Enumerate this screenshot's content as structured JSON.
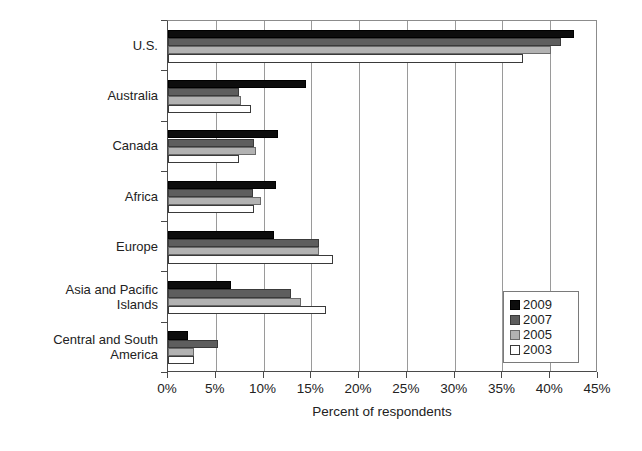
{
  "chart_data": {
    "type": "bar",
    "orientation": "horizontal",
    "title": "",
    "xlabel": "Percent of respondents",
    "ylabel": "",
    "xlim": [
      0,
      45
    ],
    "xticks": [
      "0%",
      "5%",
      "10%",
      "15%",
      "20%",
      "25%",
      "30%",
      "35%",
      "40%",
      "45%"
    ],
    "xtick_values": [
      0,
      5,
      10,
      15,
      20,
      25,
      30,
      35,
      40,
      45
    ],
    "grid": "vertical",
    "legend_position": "lower-right",
    "categories": [
      "U.S.",
      "Australia",
      "Canada",
      "Africa",
      "Europe",
      "Asia and Pacific\nIslands",
      "Central and South\nAmerica"
    ],
    "series": [
      {
        "name": "2009",
        "color": "#0d0d0d",
        "values": [
          42.5,
          14.4,
          11.5,
          11.3,
          11.1,
          6.6,
          2.1
        ]
      },
      {
        "name": "2007",
        "color": "#5e5e5e",
        "values": [
          41.1,
          7.4,
          9.0,
          8.9,
          15.8,
          12.9,
          5.2
        ]
      },
      {
        "name": "2005",
        "color": "#b2b2b2",
        "values": [
          40.1,
          7.6,
          9.2,
          9.7,
          15.8,
          13.9,
          2.7
        ]
      },
      {
        "name": "2003",
        "color": "#ffffff",
        "values": [
          37.1,
          8.7,
          7.4,
          9.0,
          17.3,
          16.5,
          2.7
        ]
      }
    ]
  },
  "legend": {
    "items": [
      {
        "label": "2009",
        "swatch": "s2009"
      },
      {
        "label": "2007",
        "swatch": "s2007"
      },
      {
        "label": "2005",
        "swatch": "s2005"
      },
      {
        "label": "2003",
        "swatch": "s2003"
      }
    ]
  }
}
